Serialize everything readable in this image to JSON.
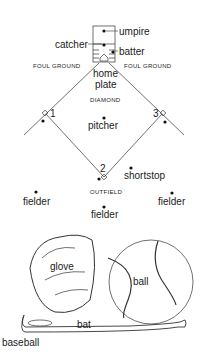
{
  "labels": {
    "umpire": "umpire",
    "catcher": "catcher",
    "batter": "batter",
    "foul_left": "FOUL GROUND",
    "foul_right": "FOUL GROUND",
    "home_plate_1": "home",
    "home_plate_2": "plate",
    "diamond": "DIAMOND",
    "base1": "1",
    "base2": "2",
    "base3": "3",
    "pitcher": "pitcher",
    "shortstop": "shortstop",
    "outfield": "OUTFIELD",
    "fielder_left": "fielder",
    "fielder_right": "fielder",
    "fielder_center": "fielder",
    "glove": "glove",
    "ball": "ball",
    "bat": "bat",
    "caption": "baseball"
  }
}
